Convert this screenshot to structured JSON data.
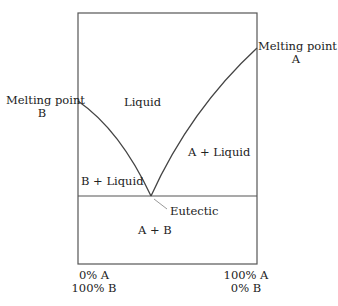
{
  "diagram": {
    "type": "eutectic phase diagram",
    "colors": {
      "line": "#555555",
      "text": "#222222",
      "background": "#ffffff",
      "leader": "#999999"
    },
    "labels": {
      "melting_point_b_line1": "Melting point",
      "melting_point_b_line2": "B",
      "melting_point_a_line1": "Melting point",
      "melting_point_a_line2": "A",
      "liquid": "Liquid",
      "a_plus_liquid": "A + Liquid",
      "b_plus_liquid": "B + Liquid",
      "eutectic": "Eutectic",
      "a_plus_b": "A + B",
      "x_left_line1": "0% A",
      "x_left_line2": "100% B",
      "x_right_line1": "100% A",
      "x_right_line2": "0% B"
    },
    "regions": [
      "Liquid",
      "A + Liquid",
      "B + Liquid",
      "A + B"
    ],
    "points": {
      "melting_point_b": {
        "x_pct_A": 0
      },
      "melting_point_a": {
        "x_pct_A": 100
      },
      "eutectic": {
        "x_pct_A": 40
      }
    }
  }
}
